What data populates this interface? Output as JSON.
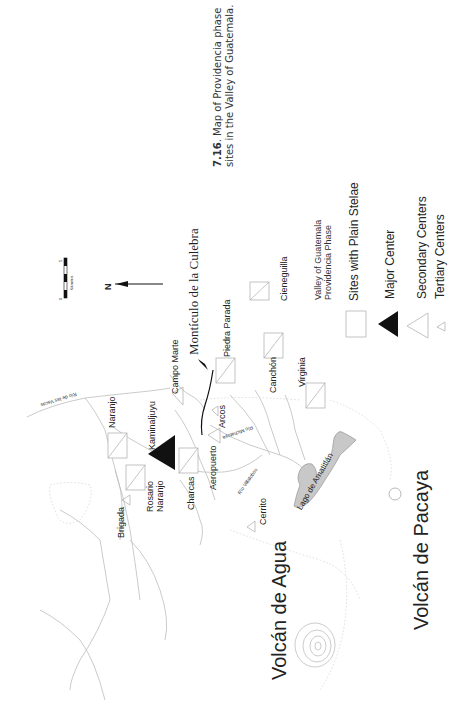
{
  "caption": {
    "number": "7.16",
    "text": ". Map of Providencia phase",
    "line2": "sites in the Valley of Guatemala."
  },
  "scale_bar": {
    "start": "0",
    "end": "5",
    "unit": "Kilometers"
  },
  "north_arrow": {
    "label": "N"
  },
  "legend": {
    "title_line1": "Valley of Guatemala",
    "title_line2": "Providencia Phase",
    "items": [
      {
        "symbol": "square",
        "label": "Sites with Plain Stelae"
      },
      {
        "symbol": "filled-triangle",
        "label": "Major Center"
      },
      {
        "symbol": "large-open-triangle",
        "label": "Secondary Centers"
      },
      {
        "symbol": "small-open-triangle",
        "label": "Tertiary Centers"
      }
    ]
  },
  "feature_label": "Montículo de la Culebra",
  "sites": {
    "naranjo": "Naranjo",
    "kaminaljuyu": "Kaminaljuyu",
    "campo_marte": "Campo Marte",
    "piedra_parada": "Piedra Parada",
    "cieneguilla": "Cieneguilla",
    "canchon": "Canchón",
    "virginia": "Virginia",
    "arcos": "Arcos",
    "aeropuerto": "Aeropuerto",
    "charcas": "Charcas",
    "rosario_naranjo_1": "Rosario",
    "rosario_naranjo_2": "Naranjo",
    "brigada": "Brigada",
    "cerrito": "Cerrito"
  },
  "rivers": {
    "vacas": "Río de las Vacas",
    "michatoya": "Río Michatoya",
    "villalobos": "Río Villalobos"
  },
  "lake": "Lago de Amatitlán",
  "volcanoes": {
    "agua": "Volcán de Agua",
    "pacaya": "Volcán de Pacaya"
  },
  "colors": {
    "lake": "#c8c8c8",
    "rivers": "#b8b8b8",
    "major_center": "#111111"
  }
}
